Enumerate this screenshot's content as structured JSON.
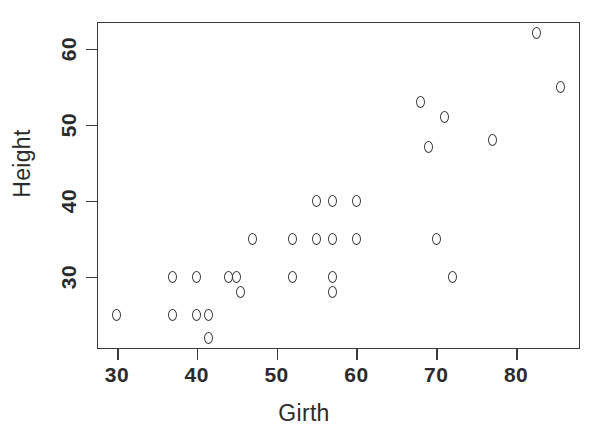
{
  "chart_data": {
    "type": "scatter",
    "title": "",
    "xlabel": "Girth",
    "ylabel": "Height",
    "xlim": [
      27.5,
      88.0
    ],
    "ylim": [
      20.5,
      63.5
    ],
    "grid": false,
    "legend": null,
    "marker": "open-circle",
    "marker_color": "#3d3d3d",
    "xticks": [
      30,
      40,
      50,
      60,
      70,
      80
    ],
    "xticklabels": [
      "30",
      "40",
      "50",
      "60",
      "70",
      "80"
    ],
    "yticks": [
      30,
      40,
      50,
      60
    ],
    "yticklabels": [
      "30",
      "40",
      "50",
      "60"
    ],
    "n_points": 31,
    "points": [
      {
        "x": 30.0,
        "y": 25.0
      },
      {
        "x": 37.0,
        "y": 30.0
      },
      {
        "x": 37.0,
        "y": 25.0
      },
      {
        "x": 40.0,
        "y": 30.0
      },
      {
        "x": 40.0,
        "y": 25.0
      },
      {
        "x": 41.5,
        "y": 25.0
      },
      {
        "x": 41.5,
        "y": 22.0
      },
      {
        "x": 44.0,
        "y": 30.0
      },
      {
        "x": 45.0,
        "y": 30.0
      },
      {
        "x": 45.5,
        "y": 28.0
      },
      {
        "x": 47.0,
        "y": 35.0
      },
      {
        "x": 52.0,
        "y": 35.0
      },
      {
        "x": 52.0,
        "y": 30.0
      },
      {
        "x": 55.0,
        "y": 40.0
      },
      {
        "x": 55.0,
        "y": 35.0
      },
      {
        "x": 57.0,
        "y": 40.0
      },
      {
        "x": 57.0,
        "y": 35.0
      },
      {
        "x": 57.0,
        "y": 30.0
      },
      {
        "x": 57.0,
        "y": 28.0
      },
      {
        "x": 60.0,
        "y": 40.0
      },
      {
        "x": 60.0,
        "y": 35.0
      },
      {
        "x": 68.0,
        "y": 53.0
      },
      {
        "x": 69.0,
        "y": 47.0
      },
      {
        "x": 70.0,
        "y": 35.0
      },
      {
        "x": 71.0,
        "y": 51.0
      },
      {
        "x": 72.0,
        "y": 30.0
      },
      {
        "x": 77.0,
        "y": 48.0
      },
      {
        "x": 82.5,
        "y": 62.0
      },
      {
        "x": 85.5,
        "y": 55.0
      }
    ]
  }
}
